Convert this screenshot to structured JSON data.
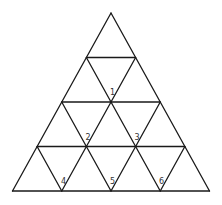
{
  "diagram": {
    "type": "triangular-grid",
    "rows": 4,
    "stroke_color": "#1a1a1a",
    "label_color": "#333333",
    "background": "#ffffff",
    "outer_triangle": {
      "apex": [
        111,
        13
      ],
      "bottom_left": [
        13,
        191
      ],
      "bottom_right": [
        210,
        191
      ]
    },
    "row_lines_y": [
      58,
      102,
      147,
      191
    ],
    "labeled_vertices": [
      {
        "label": "1",
        "x": 111,
        "y": 102
      },
      {
        "label": "2",
        "x": 86.5,
        "y": 147
      },
      {
        "label": "3",
        "x": 135.5,
        "y": 147
      },
      {
        "label": "4",
        "x": 62,
        "y": 191
      },
      {
        "label": "5",
        "x": 111,
        "y": 191
      },
      {
        "label": "6",
        "x": 160,
        "y": 191
      }
    ]
  }
}
